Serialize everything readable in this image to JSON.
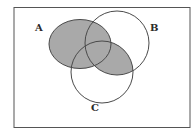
{
  "diagram": {
    "type": "venn",
    "sets": [
      {
        "id": "A",
        "label": "A"
      },
      {
        "id": "B",
        "label": "B"
      },
      {
        "id": "C",
        "label": "C"
      }
    ],
    "shaded_regions": [
      "A",
      "B∩C"
    ],
    "colors": {
      "shade": "#a9a9a9",
      "stroke": "#4a4a4a",
      "frame": "#555555",
      "background": "#ffffff"
    }
  }
}
